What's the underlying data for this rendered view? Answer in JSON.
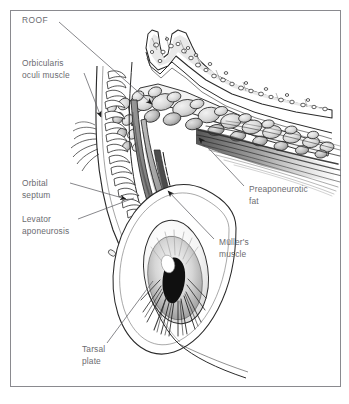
{
  "figure": {
    "style": "grayscale pen-and-ink medical illustration",
    "border_color": "#8a8a8f",
    "background_color": "#ffffff",
    "label_color": "#6b6b70",
    "ink_color": "#2a2a2a"
  },
  "labels": [
    {
      "id": "roof",
      "text": "ROOF",
      "lines": [
        "ROOF"
      ],
      "x": 22,
      "y": 23,
      "side": "left",
      "leader": {
        "x1": 59,
        "y1": 22,
        "x2": 155,
        "y2": 107,
        "arrow": true
      }
    },
    {
      "id": "orbicularis-oculi-muscle",
      "text": "Orbicularis oculi muscle",
      "lines": [
        "Orbicularis",
        "oculi muscle"
      ],
      "x": 22,
      "y": 66,
      "side": "left",
      "leader": {
        "x1": 84,
        "y1": 73,
        "x2": 103,
        "y2": 120,
        "arrow": true
      }
    },
    {
      "id": "orbital-septum",
      "text": "Orbital septum",
      "lines": [
        "Orbital",
        "septum"
      ],
      "x": 22,
      "y": 186,
      "side": "left",
      "leader": {
        "x1": 70,
        "y1": 183,
        "x2": 130,
        "y2": 200,
        "arrow": true
      }
    },
    {
      "id": "levator-aponeurosis",
      "text": "Levator aponeurosis",
      "lines": [
        "Levator",
        "aponeurosis"
      ],
      "x": 22,
      "y": 222,
      "side": "left",
      "leader": {
        "x1": 78,
        "y1": 219,
        "x2": 134,
        "y2": 198,
        "arrow": false
      }
    },
    {
      "id": "tarsal-plate",
      "text": "Tarsal plate",
      "lines": [
        "Tarsal",
        "plate"
      ],
      "x": 82,
      "y": 352,
      "side": "bottom",
      "leader": {
        "x1": 107,
        "y1": 343,
        "x2": 153,
        "y2": 281,
        "arrow": false
      }
    },
    {
      "id": "preaponeurotic-fat",
      "text": "Preaponeurotic fat",
      "lines": [
        "Preaponeurotic",
        "fat"
      ],
      "x": 249,
      "y": 192,
      "side": "right",
      "leader": {
        "x1": 244,
        "y1": 186,
        "x2": 196,
        "y2": 135,
        "arrow": true
      }
    },
    {
      "id": "mullers-muscle",
      "text": "Müller's muscle",
      "lines": [
        "Müller's",
        "muscle"
      ],
      "x": 219,
      "y": 245,
      "side": "right",
      "leader": {
        "x1": 214,
        "y1": 239,
        "x2": 165,
        "y2": 188,
        "arrow": true
      }
    }
  ],
  "structures": [
    {
      "id": "orbital-roof-bone",
      "name": "Orbital roof bone (cancellous)"
    },
    {
      "id": "preaponeurotic-fat-pad",
      "name": "Preaponeurotic fat lobules"
    },
    {
      "id": "levator-muscle-fibers",
      "name": "Levator palpebrae superioris fibers"
    },
    {
      "id": "orbicularis-bundles",
      "name": "Orbicularis oculi fascicles"
    },
    {
      "id": "orbital-septum-sheet",
      "name": "Orbital septum"
    },
    {
      "id": "levator-aponeurosis-sheet",
      "name": "Levator aponeurosis"
    },
    {
      "id": "mullers-muscle-sheet",
      "name": "Müller's muscle"
    },
    {
      "id": "tarsal-plate-body",
      "name": "Tarsal plate"
    },
    {
      "id": "globe",
      "name": "Globe with cornea, iris and pupil"
    },
    {
      "id": "lower-lid",
      "name": "Lower eyelid margin"
    }
  ]
}
